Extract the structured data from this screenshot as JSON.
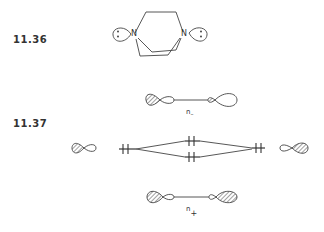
{
  "figures": [
    {
      "id": "11.36",
      "label": "11.36",
      "description": "bicyclic diamine with two nitrogen lone pairs"
    },
    {
      "id": "11.37",
      "label": "11.37",
      "description": "orbital interaction diagram of lone pairs"
    }
  ],
  "molecule": {
    "atoms": [
      "N",
      "N"
    ],
    "lone_pair_symbol": ":"
  },
  "orbitals": {
    "n_minus_label": "n",
    "n_minus_sub": "–",
    "n_plus_label": "n",
    "n_plus_sub": "+"
  },
  "energy_levels": {
    "electron_marker": "⧺",
    "levels": [
      "left",
      "upper-middle",
      "lower-middle",
      "right"
    ]
  },
  "colors": {
    "ink": "#333333",
    "background": "#ffffff"
  }
}
